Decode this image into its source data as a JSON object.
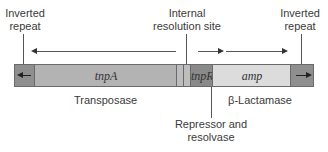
{
  "labels": {
    "left_repeat_line1": "Inverted",
    "left_repeat_line2": "repeat",
    "res_site_line1": "Internal",
    "res_site_line2": "resolution site",
    "right_repeat_line1": "Inverted",
    "right_repeat_line2": "repeat",
    "transposase": "Transposase",
    "beta_lactamase": "β-Lactamase",
    "repressor_line1": "Repressor and",
    "repressor_line2": "resolvase"
  },
  "genes": {
    "tnpA": "tnpA",
    "tnpR": "tnpR",
    "amp": "amp"
  },
  "colors": {
    "repeat": "#8f8f8f",
    "tnpA": "#b3b3b3",
    "res_site": "#bdbdbd",
    "tnpR": "#8a8a8a",
    "amp": "#dcdcdc"
  }
}
